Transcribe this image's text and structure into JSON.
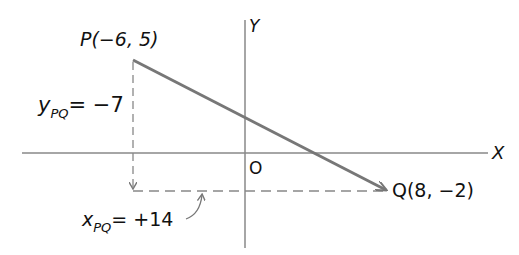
{
  "diagram": {
    "axes": {
      "x_label": "X",
      "y_label": "Y",
      "origin_label": "O"
    },
    "points": {
      "P": {
        "label": "P(−6, 5)",
        "x": -6,
        "y": 5
      },
      "Q": {
        "label": "Q(8, −2)",
        "x": 8,
        "y": -2
      }
    },
    "components": {
      "y_pq": {
        "var": "y",
        "sub": "PQ",
        "value": "= −7"
      },
      "x_pq": {
        "var": "x",
        "sub": "PQ",
        "value": "= +14"
      }
    },
    "colors": {
      "vector": "#777777",
      "axes": "#888888",
      "dashed": "#888888",
      "text": "#111111"
    }
  }
}
